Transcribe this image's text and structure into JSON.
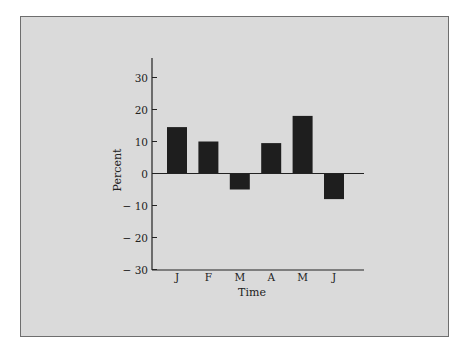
{
  "chart_data": {
    "type": "bar",
    "title": "",
    "xlabel": "Time",
    "ylabel": "Percent",
    "categories": [
      "J",
      "F",
      "M",
      "A",
      "M",
      "J"
    ],
    "values": [
      14.5,
      10,
      -5,
      9.5,
      18,
      -8
    ],
    "ylim": [
      -30,
      35
    ],
    "yticks": [
      30,
      20,
      10,
      0,
      -10,
      -20,
      -30
    ],
    "ytick_labels": [
      "30",
      "20",
      "10",
      "0",
      "− 10",
      "− 20",
      "− 30"
    ],
    "grid": false,
    "legend": null,
    "bar_color": "#1e1e1e",
    "background_color": "#dadada"
  }
}
